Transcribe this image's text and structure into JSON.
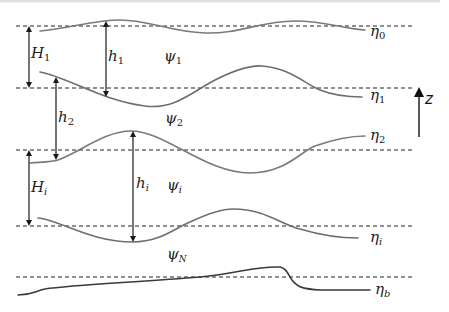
{
  "figure": {
    "colors": {
      "interface": "#7a7a7a",
      "bottom": "#3a3a3a",
      "dashed_reference": "#222222",
      "arrow": "#1a1a1a",
      "text": "#222222"
    },
    "interfaces": [
      {
        "id": "eta0",
        "symbol": "η",
        "sub": "0"
      },
      {
        "id": "eta1",
        "symbol": "η",
        "sub": "1"
      },
      {
        "id": "eta2",
        "symbol": "η",
        "sub": "2"
      },
      {
        "id": "etai",
        "symbol": "η",
        "sub": "i"
      },
      {
        "id": "etab",
        "symbol": "η",
        "sub": "b"
      }
    ],
    "mean_thickness_labels": [
      {
        "id": "H1",
        "symbol": "H",
        "sub": "1"
      },
      {
        "id": "Hi",
        "symbol": "H",
        "sub": "i"
      }
    ],
    "local_thickness_labels": [
      {
        "id": "h1",
        "symbol": "h",
        "sub": "1"
      },
      {
        "id": "h2",
        "symbol": "h",
        "sub": "2"
      },
      {
        "id": "hi",
        "symbol": "h",
        "sub": "i"
      }
    ],
    "streamfunction_labels": [
      {
        "id": "psi1",
        "symbol": "ψ",
        "sub": "1"
      },
      {
        "id": "psi2",
        "symbol": "ψ",
        "sub": "2"
      },
      {
        "id": "psii",
        "symbol": "ψ",
        "sub": "i"
      },
      {
        "id": "psiN",
        "symbol": "ψ",
        "sub": "N"
      }
    ],
    "vertical_axis": {
      "label": "z",
      "direction": "up"
    }
  }
}
